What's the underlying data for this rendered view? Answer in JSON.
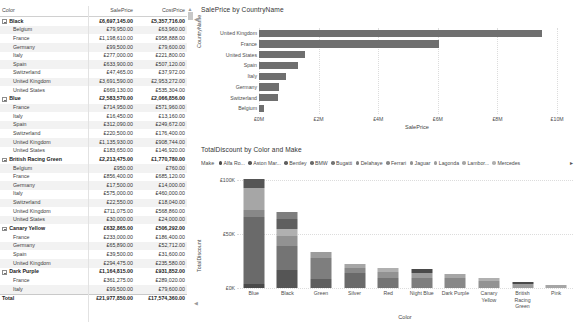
{
  "matrix": {
    "columns": [
      "Color",
      "SalePrice",
      "CostPrice"
    ],
    "rows": [
      {
        "type": "group",
        "label": "Black",
        "sale": "£6,697,145.00",
        "cost": "£5,357,716.00"
      },
      {
        "type": "child",
        "label": "Belgium",
        "sale": "£79,950.00",
        "cost": "£63,960.00"
      },
      {
        "type": "child",
        "label": "France",
        "sale": "£1,198,610.00",
        "cost": "£958,888.00"
      },
      {
        "type": "child",
        "label": "Germany",
        "sale": "£99,500.00",
        "cost": "£79,600.00"
      },
      {
        "type": "child",
        "label": "Italy",
        "sale": "£277,000.00",
        "cost": "£221,800.00"
      },
      {
        "type": "child",
        "label": "Spain",
        "sale": "£633,900.00",
        "cost": "£507,120.00"
      },
      {
        "type": "child",
        "label": "Switzerland",
        "sale": "£47,465.00",
        "cost": "£37,972.00"
      },
      {
        "type": "child",
        "label": "United Kingdom",
        "sale": "£3,691,590.00",
        "cost": "£2,953,272.00"
      },
      {
        "type": "child",
        "label": "United States",
        "sale": "£669,130.00",
        "cost": "£535,304.00"
      },
      {
        "type": "group",
        "label": "Blue",
        "sale": "£2,583,570.00",
        "cost": "£2,066,856.00"
      },
      {
        "type": "child",
        "label": "France",
        "sale": "£714,950.00",
        "cost": "£571,960.00"
      },
      {
        "type": "child",
        "label": "Italy",
        "sale": "£16,450.00",
        "cost": "£13,160.00"
      },
      {
        "type": "child",
        "label": "Spain",
        "sale": "£312,090.00",
        "cost": "£249,672.00"
      },
      {
        "type": "child",
        "label": "Switzerland",
        "sale": "£220,500.00",
        "cost": "£176,400.00"
      },
      {
        "type": "child",
        "label": "United Kingdom",
        "sale": "£1,135,930.00",
        "cost": "£908,744.00"
      },
      {
        "type": "child",
        "label": "United States",
        "sale": "£183,650.00",
        "cost": "£146,920.00"
      },
      {
        "type": "group",
        "label": "British Racing Green",
        "sale": "£2,213,475.00",
        "cost": "£1,770,780.00"
      },
      {
        "type": "child",
        "label": "Belgium",
        "sale": "£950.00",
        "cost": "£760.00"
      },
      {
        "type": "child",
        "label": "France",
        "sale": "£856,400.00",
        "cost": "£685,120.00"
      },
      {
        "type": "child",
        "label": "Germany",
        "sale": "£17,500.00",
        "cost": "£14,000.00"
      },
      {
        "type": "child",
        "label": "Italy",
        "sale": "£575,000.00",
        "cost": "£460,000.00"
      },
      {
        "type": "child",
        "label": "Switzerland",
        "sale": "£22,550.00",
        "cost": "£18,040.00"
      },
      {
        "type": "child",
        "label": "United Kingdom",
        "sale": "£711,075.00",
        "cost": "£568,860.00"
      },
      {
        "type": "child",
        "label": "United States",
        "sale": "£30,000.00",
        "cost": "£24,000.00"
      },
      {
        "type": "group",
        "label": "Canary Yellow",
        "sale": "£632,865.00",
        "cost": "£506,292.00"
      },
      {
        "type": "child",
        "label": "France",
        "sale": "£233,000.00",
        "cost": "£186,400.00"
      },
      {
        "type": "child",
        "label": "Germany",
        "sale": "£65,890.00",
        "cost": "£52,712.00"
      },
      {
        "type": "child",
        "label": "Spain",
        "sale": "£39,500.00",
        "cost": "£31,600.00"
      },
      {
        "type": "child",
        "label": "United Kingdom",
        "sale": "£294,475.00",
        "cost": "£235,580.00"
      },
      {
        "type": "group",
        "label": "Dark Purple",
        "sale": "£1,164,815.00",
        "cost": "£931,852.00"
      },
      {
        "type": "child",
        "label": "France",
        "sale": "£361,275.00",
        "cost": "£289,020.00"
      },
      {
        "type": "child",
        "label": "Italy",
        "sale": "£99,500.00",
        "cost": "£79,600.00"
      },
      {
        "type": "total",
        "label": "Total",
        "sale": "£21,977,850.00",
        "cost": "£17,574,360.00"
      }
    ]
  },
  "chart_data": [
    {
      "type": "bar",
      "title": "SalePrice by CountryName",
      "orientation": "horizontal",
      "xlabel": "SalePrice",
      "ylabel": "CountryName",
      "categories": [
        "United Kingdom",
        "France",
        "United States",
        "Spain",
        "Italy",
        "Germany",
        "Switzerland",
        "Belgium"
      ],
      "values": [
        9500000,
        6050000,
        1550000,
        1300000,
        920000,
        680000,
        640000,
        180000
      ],
      "xticks": [
        "£0M",
        "£2M",
        "£4M",
        "£6M",
        "£8M",
        "£10M"
      ],
      "xtick_values": [
        0,
        2000000,
        4000000,
        6000000,
        8000000,
        10000000
      ],
      "xlim": [
        0,
        10600000
      ],
      "grid": true,
      "series_color": "#6f6f6f",
      "legend": "none"
    },
    {
      "type": "bar",
      "subtype": "stacked-column",
      "title": "TotalDiscount by Color and Make",
      "xlabel": "Color",
      "ylabel": "TotalDiscount",
      "legend_title": "Make",
      "legend_position": "top",
      "legend_entries": [
        {
          "label": "Alfa Ro...",
          "color": "#4a4a4a"
        },
        {
          "label": "Aston Mar...",
          "color": "#555555"
        },
        {
          "label": "Bentley",
          "color": "#5f5f5f"
        },
        {
          "label": "BMW",
          "color": "#6a6a6a"
        },
        {
          "label": "Bugatti",
          "color": "#747474"
        },
        {
          "label": "Delahaye",
          "color": "#7e7e7e"
        },
        {
          "label": "Ferrari",
          "color": "#888888"
        },
        {
          "label": "Jaguar",
          "color": "#929292"
        },
        {
          "label": "Lagonda",
          "color": "#9c9c9c"
        },
        {
          "label": "Lambor...",
          "color": "#a6a6a6"
        },
        {
          "label": "Mercedes",
          "color": "#b0b0b0"
        }
      ],
      "legend_overflow": "▸",
      "categories": [
        "Blue",
        "Black",
        "Green",
        "Silver",
        "Red",
        "Night Blue",
        "Dark Purple",
        "Canary Yellow",
        "British Racing Green",
        "Pink"
      ],
      "yticks": [
        "£0K",
        "£50K",
        "£100K"
      ],
      "ytick_values": [
        0,
        50000,
        100000
      ],
      "ylim": [
        0,
        104000
      ],
      "grid": true,
      "stacks": [
        {
          "category": "Blue",
          "total": 101000,
          "segments": [
            3500,
            62000,
            7000,
            20000,
            8500
          ]
        },
        {
          "category": "Black",
          "total": 71000,
          "segments": [
            17000,
            22000,
            9000,
            6500,
            10000,
            6500
          ]
        },
        {
          "category": "Green",
          "total": 33000,
          "segments": [
            8000,
            20000,
            5000
          ]
        },
        {
          "category": "Silver",
          "total": 22500,
          "segments": [
            14000,
            4500,
            4000
          ]
        },
        {
          "category": "Red",
          "total": 18500,
          "segments": [
            9000,
            5500,
            4000
          ]
        },
        {
          "category": "Night Blue",
          "total": 17500,
          "segments": [
            9000,
            5000,
            3500
          ]
        },
        {
          "category": "Dark Purple",
          "total": 13000,
          "segments": [
            9000,
            4000
          ]
        },
        {
          "category": "Canary Yellow",
          "total": 9500,
          "segments": [
            6500,
            3000
          ]
        },
        {
          "category": "British Racing Green",
          "total": 6000,
          "segments": [
            4000,
            2000
          ]
        },
        {
          "category": "Pink",
          "total": 3000,
          "segments": [
            3000
          ]
        }
      ]
    }
  ]
}
